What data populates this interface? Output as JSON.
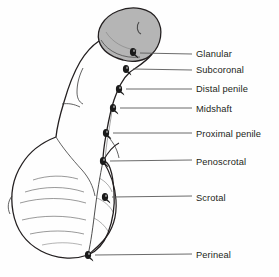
{
  "figure": {
    "background_color": "#fefefe",
    "line_color": "#231f20",
    "glans_fill_color": "#b5b5b5",
    "marker_color": "#1a1a1a",
    "leader_color": "#5a5a5a",
    "text_color": "#231f20"
  },
  "labels": [
    {
      "id": "glanular",
      "text": "Glanular",
      "text_x": 196,
      "text_y": 50,
      "marker_x": 133,
      "marker_y": 52,
      "leader_start_x": 140,
      "leader_start_y": 53,
      "leader_end_x": 192,
      "leader_end_y": 54
    },
    {
      "id": "subcoronal",
      "text": "Subcoronal",
      "text_x": 196,
      "text_y": 66,
      "marker_x": 126,
      "marker_y": 69,
      "leader_start_x": 133,
      "leader_start_y": 69,
      "leader_end_x": 192,
      "leader_end_y": 70
    },
    {
      "id": "distal-penile",
      "text": "Distal penile",
      "text_x": 196,
      "text_y": 85,
      "marker_x": 119,
      "marker_y": 89,
      "leader_start_x": 126,
      "leader_start_y": 89,
      "leader_end_x": 192,
      "leader_end_y": 89
    },
    {
      "id": "midshaft",
      "text": "Midshaft",
      "text_x": 196,
      "text_y": 105,
      "marker_x": 113,
      "marker_y": 108,
      "leader_start_x": 120,
      "leader_start_y": 108,
      "leader_end_x": 192,
      "leader_end_y": 108
    },
    {
      "id": "proximal-penile",
      "text": "Proximal penile",
      "text_x": 196,
      "text_y": 130,
      "marker_x": 106,
      "marker_y": 133,
      "leader_start_x": 113,
      "leader_start_y": 133,
      "leader_end_x": 192,
      "leader_end_y": 133
    },
    {
      "id": "penoscrotal",
      "text": "Penoscrotal",
      "text_x": 196,
      "text_y": 158,
      "marker_x": 103,
      "marker_y": 161,
      "leader_start_x": 110,
      "leader_start_y": 161,
      "leader_end_x": 192,
      "leader_end_y": 160
    },
    {
      "id": "scrotal",
      "text": "Scrotal",
      "text_x": 196,
      "text_y": 194,
      "marker_x": 105,
      "marker_y": 197,
      "leader_start_x": 112,
      "leader_start_y": 197,
      "leader_end_x": 192,
      "leader_end_y": 196
    },
    {
      "id": "perineal",
      "text": "Perineal",
      "text_x": 196,
      "text_y": 251,
      "marker_x": 88,
      "marker_y": 255,
      "leader_start_x": 95,
      "leader_start_y": 255,
      "leader_end_x": 192,
      "leader_end_y": 254
    }
  ]
}
